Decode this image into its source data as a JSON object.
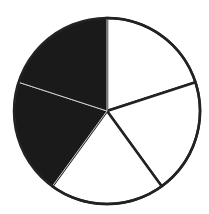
{
  "chart_data": {
    "type": "pie",
    "title": "",
    "slices": 5,
    "shaded_slices": 2,
    "fraction_shaded": "2/5",
    "values": [
      1,
      1,
      1,
      1,
      1
    ],
    "shaded": [
      false,
      false,
      false,
      true,
      true
    ],
    "colors": {
      "shaded": "#1a1a1a",
      "unshaded": "#ffffff",
      "stroke": "#222222"
    },
    "center": [
      107,
      111
    ],
    "radius": 93
  }
}
